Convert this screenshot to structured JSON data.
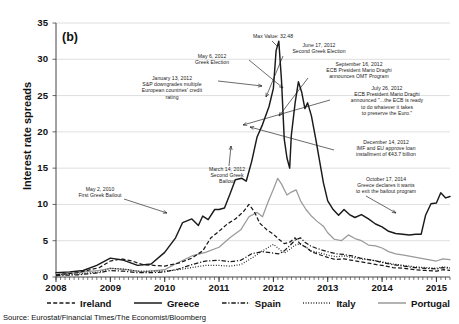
{
  "panel_label": "(b)",
  "source_note": "Source: Eurostat/Financial Times/The Economist/Bloomberg",
  "axes": {
    "ylabel": "Interest rate spreads",
    "yticks": [
      "0",
      "5",
      "10",
      "15",
      "20",
      "25",
      "30",
      "35"
    ],
    "xticks": [
      "2008",
      "2009",
      "2010",
      "2011",
      "2012",
      "2013",
      "2014",
      "2015"
    ]
  },
  "legend": [
    {
      "label": "Ireland",
      "style": "dashed",
      "color": "#1a1a1a"
    },
    {
      "label": "Greece",
      "style": "solid",
      "color": "#1a1a1a"
    },
    {
      "label": "Spain",
      "style": "dashdot",
      "color": "#1a1a1a"
    },
    {
      "label": "Italy",
      "style": "dotted",
      "color": "#1a1a1a"
    },
    {
      "label": "Portugal",
      "style": "solid",
      "color": "#9a9a9a"
    }
  ],
  "annotations": [
    {
      "name": "max-value",
      "text": "Max Value: 32.48"
    },
    {
      "name": "may-2010",
      "text": "May 2, 2010\nFirst Greek Bailout"
    },
    {
      "name": "jan-2012",
      "text": "January 13, 2012\nS&P downgrades multiple\nEuropean countries' credit\nrating"
    },
    {
      "name": "mar-2012",
      "text": "March 14, 2012\nSecond Greek\nBailout"
    },
    {
      "name": "may-2012",
      "text": "May 6, 2012\nGreek Election"
    },
    {
      "name": "jun-2012",
      "text": "June 17, 2012\nSecond Greek Election"
    },
    {
      "name": "jul-2012",
      "text": "July 26, 2012\nECB President Mario Draghi\nannounced \"...the ECB is ready\nto do whatever it takes\nto preserve the Euro.\""
    },
    {
      "name": "sep-2012",
      "text": "September 16, 2012\nECB President Mario Draghi\nannounces OMT Program"
    },
    {
      "name": "dec-2012",
      "text": "December 14, 2012\nIMF and EU approve loan\ninstallment of €43.7 billion"
    },
    {
      "name": "oct-2014",
      "text": "October 17, 2014\nGreece declares it wants\nto exit the bailout program"
    }
  ],
  "chart_data": {
    "type": "line",
    "title": "",
    "xlabel": "",
    "ylabel": "Interest rate spreads",
    "xlim": [
      2008,
      2015.25
    ],
    "ylim": [
      0,
      35
    ],
    "grid": "horizontal",
    "legend_position": "bottom",
    "max_value": 32.48,
    "series": [
      {
        "name": "Greece",
        "style": "solid",
        "color": "#1a1a1a",
        "points": [
          [
            2008.0,
            0.6
          ],
          [
            2008.25,
            0.7
          ],
          [
            2008.5,
            0.9
          ],
          [
            2008.75,
            1.6
          ],
          [
            2009.0,
            2.6
          ],
          [
            2009.25,
            2.3
          ],
          [
            2009.5,
            1.6
          ],
          [
            2009.75,
            1.8
          ],
          [
            2010.0,
            3.4
          ],
          [
            2010.2,
            5.4
          ],
          [
            2010.33,
            7.5
          ],
          [
            2010.5,
            8.0
          ],
          [
            2010.62,
            7.1
          ],
          [
            2010.7,
            8.4
          ],
          [
            2010.8,
            7.9
          ],
          [
            2010.92,
            9.3
          ],
          [
            2011.0,
            9.3
          ],
          [
            2011.1,
            9.5
          ],
          [
            2011.2,
            11.4
          ],
          [
            2011.3,
            13.4
          ],
          [
            2011.42,
            13.6
          ],
          [
            2011.5,
            13.2
          ],
          [
            2011.6,
            15.9
          ],
          [
            2011.7,
            19.3
          ],
          [
            2011.8,
            21.0
          ],
          [
            2011.92,
            23.5
          ],
          [
            2012.0,
            26.0
          ],
          [
            2012.05,
            31.2
          ],
          [
            2012.1,
            32.48
          ],
          [
            2012.15,
            27.0
          ],
          [
            2012.2,
            19.0
          ],
          [
            2012.25,
            16.4
          ],
          [
            2012.3,
            15.0
          ],
          [
            2012.33,
            19.5
          ],
          [
            2012.4,
            24.0
          ],
          [
            2012.46,
            26.9
          ],
          [
            2012.52,
            25.5
          ],
          [
            2012.58,
            23.2
          ],
          [
            2012.63,
            24.0
          ],
          [
            2012.7,
            22.2
          ],
          [
            2012.78,
            19.0
          ],
          [
            2012.85,
            16.0
          ],
          [
            2012.92,
            13.0
          ],
          [
            2013.0,
            10.5
          ],
          [
            2013.1,
            9.3
          ],
          [
            2013.2,
            8.5
          ],
          [
            2013.3,
            9.3
          ],
          [
            2013.4,
            8.6
          ],
          [
            2013.5,
            8.2
          ],
          [
            2013.62,
            8.6
          ],
          [
            2013.75,
            8.0
          ],
          [
            2013.88,
            7.3
          ],
          [
            2014.0,
            6.9
          ],
          [
            2014.12,
            6.3
          ],
          [
            2014.25,
            6.0
          ],
          [
            2014.38,
            5.9
          ],
          [
            2014.5,
            5.8
          ],
          [
            2014.62,
            5.9
          ],
          [
            2014.72,
            5.9
          ],
          [
            2014.8,
            8.5
          ],
          [
            2014.9,
            10.1
          ],
          [
            2015.0,
            10.2
          ],
          [
            2015.08,
            11.6
          ],
          [
            2015.17,
            10.9
          ],
          [
            2015.25,
            11.1
          ]
        ]
      },
      {
        "name": "Portugal",
        "style": "solid",
        "color": "#9a9a9a",
        "points": [
          [
            2008.0,
            0.4
          ],
          [
            2008.4,
            0.6
          ],
          [
            2008.8,
            0.9
          ],
          [
            2009.0,
            1.2
          ],
          [
            2009.3,
            1.0
          ],
          [
            2009.6,
            0.7
          ],
          [
            2010.0,
            1.0
          ],
          [
            2010.25,
            2.0
          ],
          [
            2010.5,
            2.9
          ],
          [
            2010.75,
            3.4
          ],
          [
            2011.0,
            4.1
          ],
          [
            2011.2,
            5.4
          ],
          [
            2011.4,
            6.5
          ],
          [
            2011.55,
            8.3
          ],
          [
            2011.7,
            8.9
          ],
          [
            2011.8,
            8.3
          ],
          [
            2011.9,
            10.3
          ],
          [
            2012.0,
            12.1
          ],
          [
            2012.08,
            13.6
          ],
          [
            2012.15,
            12.8
          ],
          [
            2012.25,
            11.3
          ],
          [
            2012.33,
            11.7
          ],
          [
            2012.42,
            12.0
          ],
          [
            2012.5,
            10.5
          ],
          [
            2012.6,
            9.3
          ],
          [
            2012.7,
            8.4
          ],
          [
            2012.8,
            7.7
          ],
          [
            2012.92,
            7.0
          ],
          [
            2013.0,
            6.1
          ],
          [
            2013.12,
            5.2
          ],
          [
            2013.25,
            5.0
          ],
          [
            2013.38,
            5.8
          ],
          [
            2013.5,
            5.3
          ],
          [
            2013.62,
            5.0
          ],
          [
            2013.75,
            4.4
          ],
          [
            2013.88,
            4.3
          ],
          [
            2014.0,
            4.0
          ],
          [
            2014.12,
            3.5
          ],
          [
            2014.25,
            3.2
          ],
          [
            2014.4,
            3.0
          ],
          [
            2014.55,
            2.8
          ],
          [
            2014.7,
            2.6
          ],
          [
            2014.85,
            2.4
          ],
          [
            2015.0,
            2.2
          ],
          [
            2015.12,
            2.5
          ],
          [
            2015.25,
            2.4
          ]
        ]
      },
      {
        "name": "Ireland",
        "style": "dashed",
        "color": "#1a1a1a",
        "points": [
          [
            2008.0,
            0.3
          ],
          [
            2008.4,
            0.6
          ],
          [
            2008.8,
            1.3
          ],
          [
            2009.0,
            2.2
          ],
          [
            2009.2,
            2.5
          ],
          [
            2009.4,
            2.2
          ],
          [
            2009.6,
            1.7
          ],
          [
            2009.8,
            1.6
          ],
          [
            2010.0,
            1.5
          ],
          [
            2010.25,
            1.9
          ],
          [
            2010.5,
            2.6
          ],
          [
            2010.7,
            3.6
          ],
          [
            2010.85,
            5.4
          ],
          [
            2011.0,
            6.3
          ],
          [
            2011.15,
            7.3
          ],
          [
            2011.3,
            8.0
          ],
          [
            2011.45,
            9.0
          ],
          [
            2011.55,
            10.0
          ],
          [
            2011.65,
            9.0
          ],
          [
            2011.75,
            7.4
          ],
          [
            2011.88,
            6.5
          ],
          [
            2012.0,
            5.9
          ],
          [
            2012.1,
            5.2
          ],
          [
            2012.2,
            4.6
          ],
          [
            2012.3,
            4.8
          ],
          [
            2012.4,
            5.4
          ],
          [
            2012.5,
            4.5
          ],
          [
            2012.6,
            4.1
          ],
          [
            2012.7,
            3.5
          ],
          [
            2012.8,
            3.2
          ],
          [
            2012.92,
            2.9
          ],
          [
            2013.0,
            2.7
          ],
          [
            2013.15,
            2.4
          ],
          [
            2013.3,
            2.5
          ],
          [
            2013.45,
            2.3
          ],
          [
            2013.6,
            2.1
          ],
          [
            2013.75,
            1.9
          ],
          [
            2013.9,
            1.7
          ],
          [
            2014.0,
            1.6
          ],
          [
            2014.2,
            1.3
          ],
          [
            2014.4,
            1.2
          ],
          [
            2014.6,
            1.0
          ],
          [
            2014.8,
            0.9
          ],
          [
            2015.0,
            0.8
          ],
          [
            2015.12,
            1.0
          ],
          [
            2015.25,
            0.9
          ]
        ]
      },
      {
        "name": "Spain",
        "style": "dashdot",
        "color": "#1a1a1a",
        "points": [
          [
            2008.0,
            0.2
          ],
          [
            2008.4,
            0.3
          ],
          [
            2008.8,
            0.6
          ],
          [
            2009.0,
            0.9
          ],
          [
            2009.25,
            0.8
          ],
          [
            2009.5,
            0.6
          ],
          [
            2009.75,
            0.6
          ],
          [
            2010.0,
            0.7
          ],
          [
            2010.25,
            1.1
          ],
          [
            2010.5,
            1.7
          ],
          [
            2010.75,
            2.2
          ],
          [
            2011.0,
            2.3
          ],
          [
            2011.2,
            2.1
          ],
          [
            2011.4,
            2.3
          ],
          [
            2011.6,
            3.2
          ],
          [
            2011.8,
            3.5
          ],
          [
            2012.0,
            3.3
          ],
          [
            2012.1,
            3.2
          ],
          [
            2012.2,
            3.6
          ],
          [
            2012.3,
            4.3
          ],
          [
            2012.4,
            5.1
          ],
          [
            2012.5,
            5.4
          ],
          [
            2012.58,
            4.8
          ],
          [
            2012.68,
            4.3
          ],
          [
            2012.78,
            4.0
          ],
          [
            2012.9,
            3.7
          ],
          [
            2013.0,
            3.5
          ],
          [
            2013.15,
            3.2
          ],
          [
            2013.3,
            3.1
          ],
          [
            2013.45,
            2.9
          ],
          [
            2013.6,
            2.6
          ],
          [
            2013.75,
            2.4
          ],
          [
            2013.9,
            2.2
          ],
          [
            2014.0,
            2.0
          ],
          [
            2014.2,
            1.7
          ],
          [
            2014.4,
            1.5
          ],
          [
            2014.6,
            1.3
          ],
          [
            2014.8,
            1.2
          ],
          [
            2015.0,
            1.1
          ],
          [
            2015.12,
            1.3
          ],
          [
            2015.25,
            1.2
          ]
        ]
      },
      {
        "name": "Italy",
        "style": "dotted",
        "color": "#1a1a1a",
        "points": [
          [
            2008.0,
            0.3
          ],
          [
            2008.4,
            0.4
          ],
          [
            2008.8,
            0.7
          ],
          [
            2009.0,
            1.2
          ],
          [
            2009.25,
            1.1
          ],
          [
            2009.5,
            0.8
          ],
          [
            2009.75,
            0.8
          ],
          [
            2010.0,
            0.8
          ],
          [
            2010.25,
            1.0
          ],
          [
            2010.5,
            1.3
          ],
          [
            2010.75,
            1.6
          ],
          [
            2011.0,
            1.6
          ],
          [
            2011.2,
            1.5
          ],
          [
            2011.4,
            1.7
          ],
          [
            2011.6,
            2.6
          ],
          [
            2011.8,
            3.6
          ],
          [
            2012.0,
            4.5
          ],
          [
            2012.1,
            3.9
          ],
          [
            2012.2,
            3.3
          ],
          [
            2012.3,
            3.8
          ],
          [
            2012.4,
            4.4
          ],
          [
            2012.5,
            4.6
          ],
          [
            2012.6,
            4.1
          ],
          [
            2012.7,
            3.6
          ],
          [
            2012.8,
            3.4
          ],
          [
            2012.92,
            3.2
          ],
          [
            2013.0,
            3.0
          ],
          [
            2013.15,
            2.8
          ],
          [
            2013.3,
            2.9
          ],
          [
            2013.45,
            2.7
          ],
          [
            2013.6,
            2.5
          ],
          [
            2013.75,
            2.4
          ],
          [
            2013.9,
            2.2
          ],
          [
            2014.0,
            2.1
          ],
          [
            2014.2,
            1.8
          ],
          [
            2014.4,
            1.6
          ],
          [
            2014.6,
            1.4
          ],
          [
            2014.8,
            1.3
          ],
          [
            2015.0,
            1.2
          ],
          [
            2015.12,
            1.4
          ],
          [
            2015.25,
            1.3
          ]
        ]
      }
    ]
  }
}
